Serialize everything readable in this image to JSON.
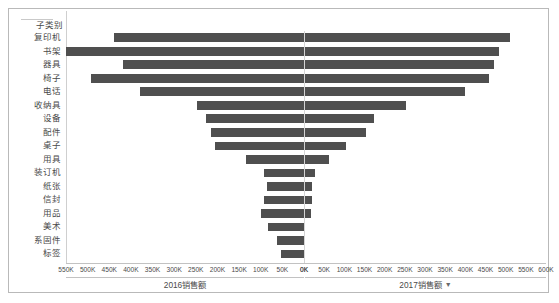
{
  "chart_data": {
    "type": "bar",
    "subtype": "butterfly-tornado",
    "title": "",
    "category_header": "子类别",
    "categories": [
      "复印机",
      "书架",
      "器具",
      "椅子",
      "电话",
      "收纳具",
      "设备",
      "配件",
      "桌子",
      "用具",
      "装订机",
      "纸张",
      "信封",
      "用品",
      "美术",
      "系固件",
      "标签"
    ],
    "series": [
      {
        "name": "2016销售额",
        "direction": "left",
        "axis_label": "2016销售额",
        "xlim": [
          0,
          550000
        ],
        "tick_labels": [
          "550K",
          "500K",
          "450K",
          "400K",
          "350K",
          "300K",
          "250K",
          "200K",
          "150K",
          "100K",
          "50K",
          "0K"
        ],
        "tick_values": [
          550000,
          500000,
          450000,
          400000,
          350000,
          300000,
          250000,
          200000,
          150000,
          100000,
          50000,
          0
        ],
        "values": [
          440000,
          550000,
          418000,
          492000,
          378000,
          248000,
          226000,
          215000,
          206000,
          134000,
          92000,
          85000,
          92000,
          100000,
          83000,
          63000,
          54000
        ]
      },
      {
        "name": "2017销售额",
        "direction": "right",
        "axis_label": "2017销售额",
        "sort_indicator": "▼",
        "xlim": [
          0,
          600000
        ],
        "tick_labels": [
          "0K",
          "50K",
          "100K",
          "150K",
          "200K",
          "250K",
          "300K",
          "350K",
          "400K",
          "450K",
          "500K",
          "550K",
          "600K"
        ],
        "tick_values": [
          0,
          50000,
          100000,
          150000,
          200000,
          250000,
          300000,
          350000,
          400000,
          450000,
          500000,
          550000,
          600000
        ],
        "values": [
          510000,
          483000,
          471000,
          459000,
          399000,
          253000,
          174000,
          154000,
          104000,
          62000,
          27000,
          20000,
          20000,
          17000,
          2000,
          0,
          0
        ]
      }
    ],
    "grid": false,
    "legend": "none",
    "bar_color": "#4f4f4f"
  },
  "colors": {
    "bar": "#4f4f4f",
    "frame_border": "#b9b9b9",
    "axis_line": "#c2c2c2",
    "center_axis": "#d4d4d4",
    "text": "#4a4a4a"
  }
}
